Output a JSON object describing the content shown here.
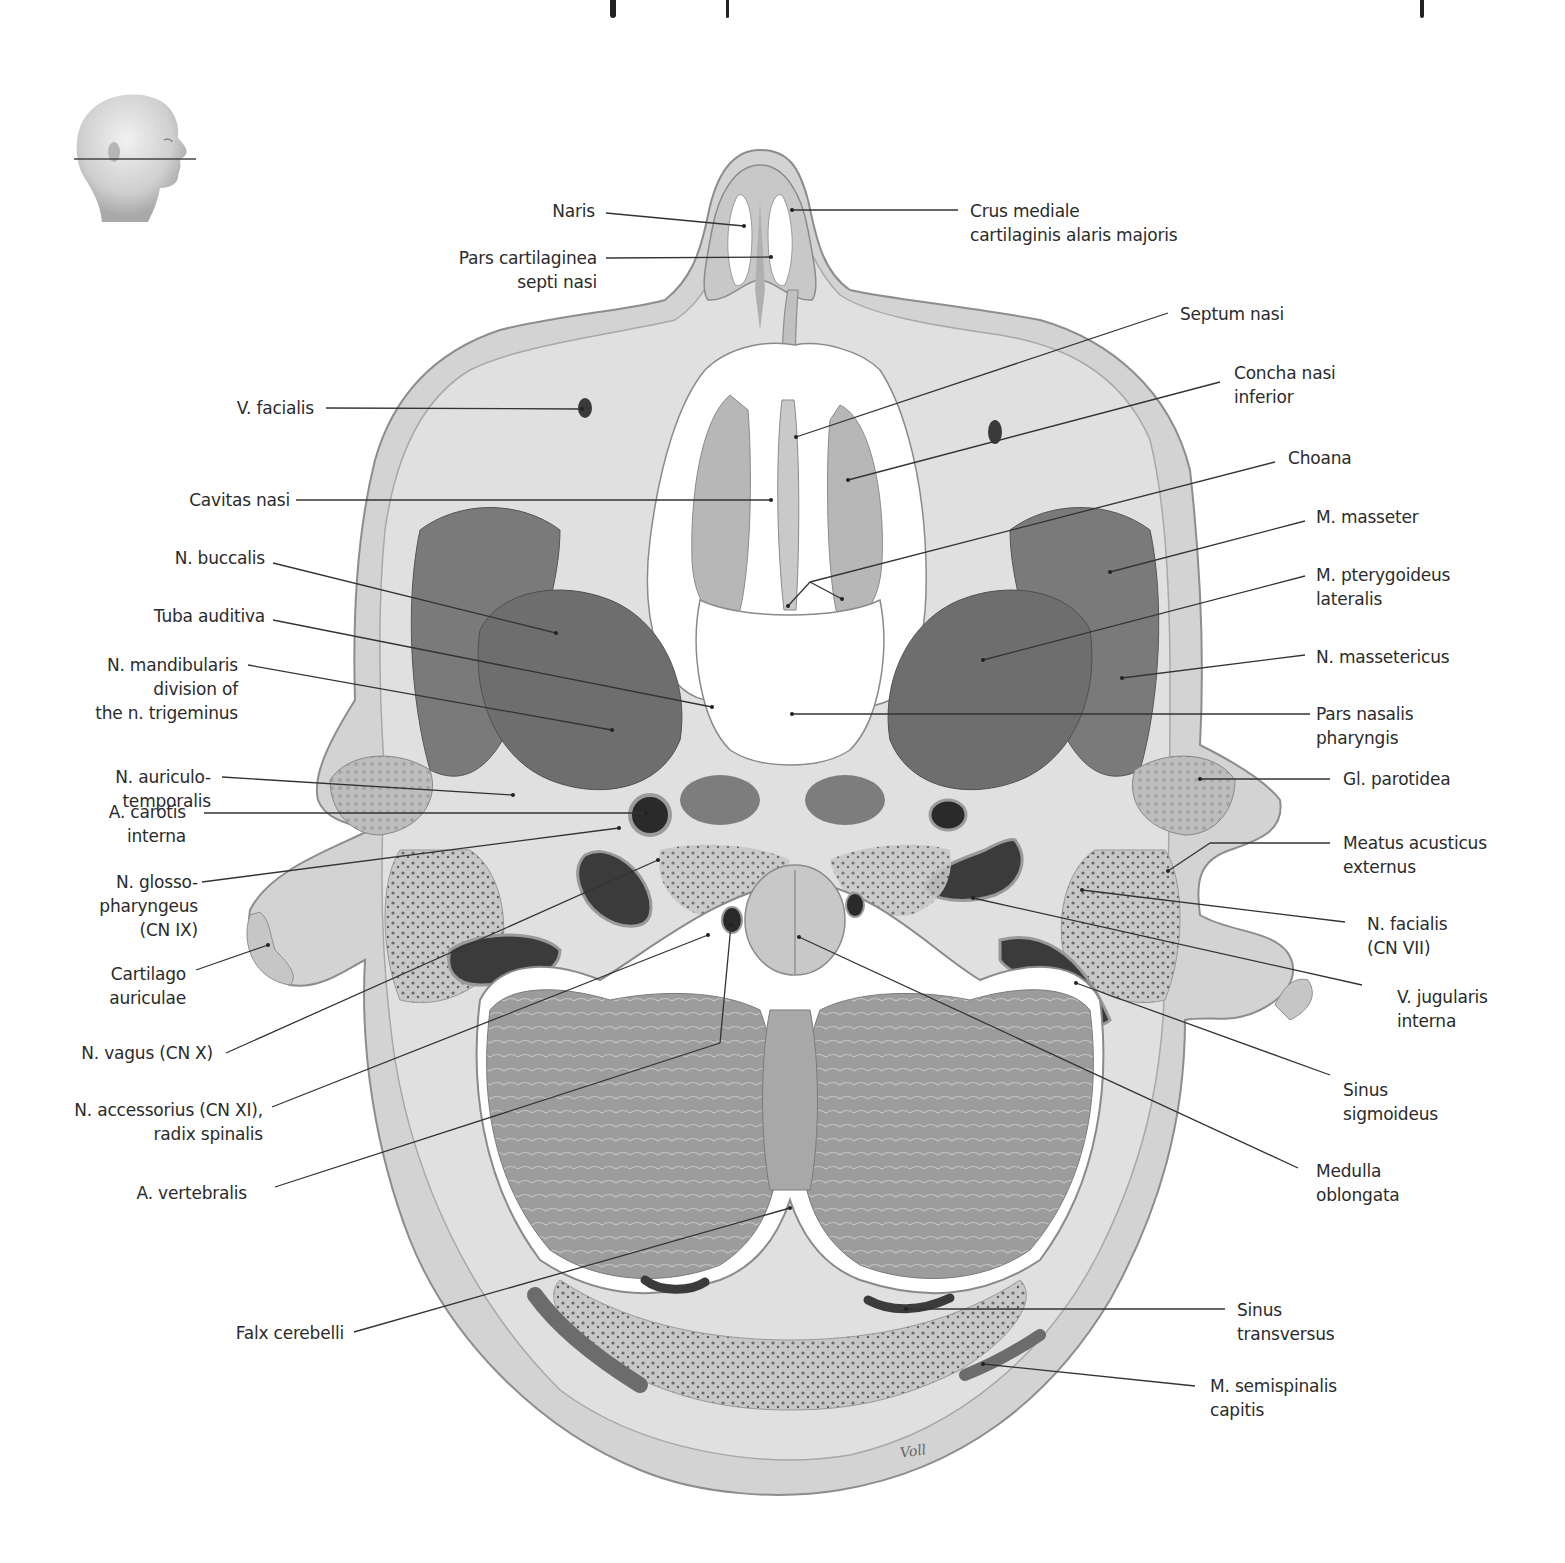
{
  "figure": {
    "title_fragment_visible": true,
    "orientation_inset": {
      "description": "head profile facing right with horizontal section plane line through the nose",
      "icon": "head-profile-section-plane-icon"
    },
    "signature": "Voll",
    "colors": {
      "background": "#ffffff",
      "skin": "#c9c9c9",
      "soft_tissue": "#d6d6d6",
      "muscle": "#7c7c7c",
      "bone_cortex": "#bdbdbd",
      "cerebellum": "#a3a3a3",
      "vessel_dark": "#2e2e2e",
      "airway": "#ffffff",
      "leader_line": "#333333",
      "label_text": "#2b2b2b"
    }
  },
  "labels": {
    "naris": [
      "Naris"
    ],
    "crus_mediale": [
      "Crus mediale",
      "cartilaginis alaris majoris"
    ],
    "pars_cartilaginea": [
      "Pars cartilaginea",
      "septi nasi"
    ],
    "septum_nasi": [
      "Septum nasi"
    ],
    "v_facialis": [
      "V. facialis"
    ],
    "concha_nasi_inferior": [
      "Concha nasi",
      "inferior"
    ],
    "choana": [
      "Choana"
    ],
    "cavitas_nasi": [
      "Cavitas nasi"
    ],
    "m_masseter": [
      "M. masseter"
    ],
    "n_buccalis": [
      "N. buccalis"
    ],
    "m_pterygoideus_lateralis": [
      "M. pterygoideus",
      "lateralis"
    ],
    "tuba_auditiva": [
      "Tuba auditiva"
    ],
    "n_massetericus": [
      "N. massetericus"
    ],
    "n_mandibularis": [
      "N. mandibularis",
      "division of",
      "the n. trigeminus"
    ],
    "pars_nasalis_pharyngis": [
      "Pars nasalis",
      "pharyngis"
    ],
    "n_auriculotemporalis": [
      "N. auriculo-",
      "temporalis"
    ],
    "gl_parotidea": [
      "Gl. parotidea"
    ],
    "a_carotis_interna": [
      "A. carotis",
      "interna"
    ],
    "meatus_acusticus_externus": [
      "Meatus acusticus",
      "externus"
    ],
    "n_glossopharyngeus": [
      "N. glosso-",
      "pharyngeus",
      "(CN IX)"
    ],
    "n_facialis": [
      "N. facialis",
      "(CN VII)"
    ],
    "cartilago_auriculae": [
      "Cartilago",
      "auriculae"
    ],
    "v_jugularis_interna": [
      "V. jugularis",
      "interna"
    ],
    "n_vagus": [
      "N. vagus (CN X)"
    ],
    "sinus_sigmoideus": [
      "Sinus",
      "sigmoideus"
    ],
    "n_accessorius": [
      "N. accessorius (CN XI),",
      "radix spinalis"
    ],
    "medulla_oblongata": [
      "Medulla",
      "oblongata"
    ],
    "a_vertebralis": [
      "A. vertebralis"
    ],
    "falx_cerebelli": [
      "Falx cerebelli"
    ],
    "sinus_transversus": [
      "Sinus",
      "transversus"
    ],
    "m_semispinalis_capitis": [
      "M. semispinalis",
      "capitis"
    ]
  }
}
